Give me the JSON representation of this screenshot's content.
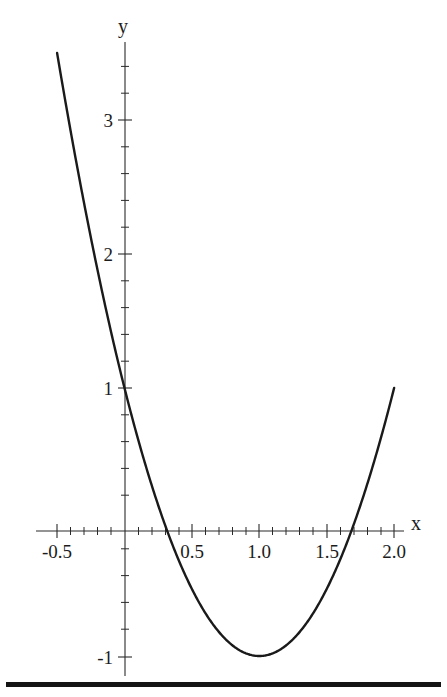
{
  "figure": {
    "background_color": "#ffffff",
    "ink_color": "#1c1c1c",
    "curve_color": "#1a1a1a",
    "bottom_rule": {
      "name": "horizontal-rule",
      "color": "#141414"
    }
  },
  "axes": {
    "x_axis_label": "x",
    "y_axis_label": "y",
    "x_ticks": [
      "-0.5",
      "0.5",
      "1.0",
      "1.5",
      "2.0"
    ],
    "x_tick_values": [
      -0.5,
      0.5,
      1.0,
      1.5,
      2.0
    ],
    "y_ticks": [
      "3",
      "2",
      "1",
      "-1"
    ],
    "y_tick_values": [
      3,
      2,
      1,
      -1
    ],
    "x_minor_step": 0.1,
    "y_minor_step": 0.2
  },
  "chart_data": {
    "type": "line",
    "title": "",
    "subtitle": "",
    "xlabel": "x",
    "ylabel": "y",
    "xlim": [
      -0.5,
      2.0
    ],
    "ylim": [
      -1.1,
      3.6
    ],
    "grid": false,
    "legend": null,
    "axis_style": "cartesian-crosshair-spines",
    "xticks": [
      -0.5,
      0.5,
      1.0,
      1.5,
      2.0
    ],
    "xticklabels": [
      "-0.5",
      "0.5",
      "1.0",
      "1.5",
      "2.0"
    ],
    "yticks": [
      3,
      2,
      1,
      -1
    ],
    "yticklabels": [
      "3",
      "2",
      "1",
      "-1"
    ],
    "series": [
      {
        "name": "f(x) = 2x^2 - 4x + 1",
        "expression": "2*x^2 - 4*x + 1",
        "color": "#1a1a1a",
        "linewidth": 2.4,
        "x": [
          -0.5,
          -0.4,
          -0.3,
          -0.2,
          -0.1,
          0.0,
          0.1,
          0.2,
          0.3,
          0.4,
          0.5,
          0.6,
          0.7,
          0.8,
          0.9,
          1.0,
          1.1,
          1.2,
          1.3,
          1.4,
          1.5,
          1.6,
          1.7,
          1.8,
          1.9,
          2.0
        ],
        "y": [
          3.5,
          2.92,
          2.38,
          1.88,
          1.42,
          1.0,
          0.62,
          0.28,
          -0.02,
          -0.28,
          -0.5,
          -0.68,
          -0.82,
          -0.92,
          -0.98,
          -1.0,
          -0.98,
          -0.92,
          -0.82,
          -0.68,
          -0.5,
          -0.28,
          -0.02,
          0.28,
          0.62,
          1.0
        ],
        "vertex": [
          1.0,
          -1.0
        ],
        "roots": [
          0.2929,
          1.7071
        ],
        "y_intercept": 1.0,
        "endpoints": [
          [
            -0.5,
            3.5
          ],
          [
            2.0,
            1.0
          ]
        ]
      }
    ],
    "annotations": []
  }
}
